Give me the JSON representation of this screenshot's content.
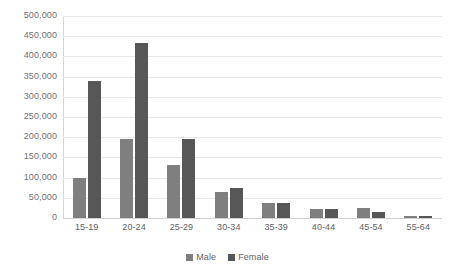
{
  "chart_data": {
    "type": "bar",
    "title": "",
    "xlabel": "",
    "ylabel": "",
    "categories": [
      "15-19",
      "20-24",
      "25-29",
      "30-34",
      "35-39",
      "40-44",
      "45-54",
      "55-64"
    ],
    "series": [
      {
        "name": "Male",
        "color": "#7f7f7f",
        "values": [
          98000,
          195000,
          130000,
          65000,
          38000,
          22000,
          25000,
          6000
        ]
      },
      {
        "name": "Female",
        "color": "#575757",
        "values": [
          338000,
          432000,
          195000,
          75000,
          38000,
          22000,
          15000,
          5000
        ]
      }
    ],
    "ylim": [
      0,
      500000
    ],
    "ytick_step": 50000,
    "ytick_labels": [
      "500,000",
      "450,000",
      "400,000",
      "350,000",
      "300,000",
      "250,000",
      "200,000",
      "150,000",
      "100,000",
      "50,000",
      "0"
    ],
    "grid": true,
    "legend_position": "bottom",
    "colors": {
      "male": "#7f7f7f",
      "female": "#575757",
      "gridline": "#e8e8e8",
      "axis": "#d4d4d4",
      "tick_text": "#6f6f6f",
      "background": "#ffffff"
    }
  }
}
